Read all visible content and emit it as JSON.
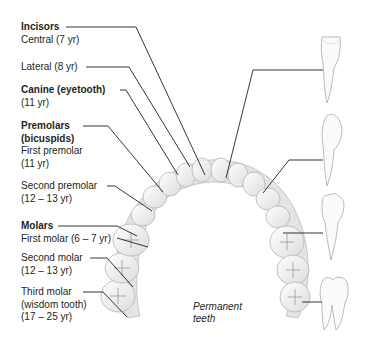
{
  "title": "Permanent teeth",
  "caption": [
    "Permanent",
    "teeth"
  ],
  "groups": [
    {
      "heading": "Incisors",
      "items": [
        {
          "name": "Central",
          "age": "(7 yr)",
          "label": "Central (7 yr)"
        },
        {
          "name": "Lateral",
          "age": "(8 yr)",
          "label": "Lateral (8 yr)"
        }
      ]
    },
    {
      "heading": "Canine (eyetooth)",
      "items": [
        {
          "name": "Canine",
          "age": "(11 yr)",
          "label": "(11 yr)"
        }
      ]
    },
    {
      "heading": "Premolars",
      "subheading": "(bicuspids)",
      "items": [
        {
          "name": "First premolar",
          "age": "(11 yr)",
          "label": "First premolar",
          "label2": "(11 yr)"
        },
        {
          "name": "Second premolar",
          "age": "(12 – 13 yr)",
          "label": "Second premolar",
          "label2": "(12 – 13 yr)"
        }
      ]
    },
    {
      "heading": "Molars",
      "items": [
        {
          "name": "First molar",
          "age": "(6 – 7 yr)",
          "label": "First molar (6 – 7 yr)"
        },
        {
          "name": "Second molar",
          "age": "(12 – 13 yr)",
          "label": "Second molar",
          "label2": "(12 – 13 yr)"
        },
        {
          "name": "Third molar",
          "alt": "(wisdom tooth)",
          "age": "(17 – 25 yr)",
          "label": "Third molar",
          "label2": "(wisdom tooth)",
          "label3": "(17 – 25 yr)"
        }
      ]
    }
  ],
  "side_teeth": [
    "incisor",
    "canine",
    "premolar",
    "molar"
  ],
  "colors": {
    "line": "#231f20",
    "text": "#231f20",
    "tooth": "#f4f4f4",
    "tooth_edge": "#b9b9b9",
    "gum": "#e2e2e2"
  }
}
